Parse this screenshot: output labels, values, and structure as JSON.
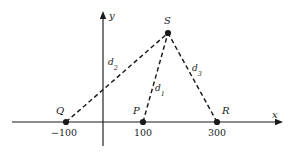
{
  "figure": {
    "width": 291,
    "height": 157,
    "background_color": "#ffffff",
    "stroke_color": "#1a1a1a"
  },
  "axes": {
    "x_axis": {
      "label": "x",
      "label_x": 272,
      "label_y": 110,
      "line_y": 122,
      "x_start": 12,
      "x_end": 283,
      "has_arrow": true
    },
    "y_axis": {
      "label": "y",
      "label_x": 109,
      "label_y": 11,
      "line_x": 103,
      "y_start": 11,
      "y_end": 146,
      "has_arrow": true
    }
  },
  "ticks": [
    {
      "name": "tick-minus-100",
      "label": "−100",
      "cx": 64,
      "cy": 128
    },
    {
      "name": "tick-100",
      "label": "100",
      "cx": 143,
      "cy": 128
    },
    {
      "name": "tick-300",
      "label": "300",
      "cx": 217,
      "cy": 128
    }
  ],
  "points": [
    {
      "id": "Q",
      "label": "Q",
      "x": 66,
      "y": 122,
      "label_x": 56,
      "label_y": 106,
      "value": -100
    },
    {
      "id": "P",
      "label": "P",
      "x": 143,
      "y": 122,
      "label_x": 133,
      "label_y": 106,
      "value": 100
    },
    {
      "id": "R",
      "label": "R",
      "x": 217,
      "y": 122,
      "label_x": 222,
      "label_y": 106,
      "value": 300
    },
    {
      "id": "S",
      "label": "S",
      "x": 168,
      "y": 33,
      "label_x": 164,
      "label_y": 16,
      "value": null
    }
  ],
  "segments": [
    {
      "id": "d2",
      "label": "d",
      "subscript": "2",
      "from": "Q",
      "to": "S",
      "x1": 66,
      "y1": 122,
      "x2": 168,
      "y2": 33,
      "label_x": 108,
      "label_y": 58
    },
    {
      "id": "d1",
      "label": "d",
      "subscript": "1",
      "from": "P",
      "to": "S",
      "x1": 143,
      "y1": 122,
      "x2": 168,
      "y2": 33,
      "label_x": 155,
      "label_y": 84
    },
    {
      "id": "d3",
      "label": "d",
      "subscript": "3",
      "from": "R",
      "to": "S",
      "x1": 217,
      "y1": 122,
      "x2": 168,
      "y2": 33,
      "label_x": 192,
      "label_y": 64
    }
  ],
  "style": {
    "dash_pattern": "4.5,3",
    "line_width": 1.15,
    "dash_width": 1.45,
    "dot_radius": 3.1
  }
}
